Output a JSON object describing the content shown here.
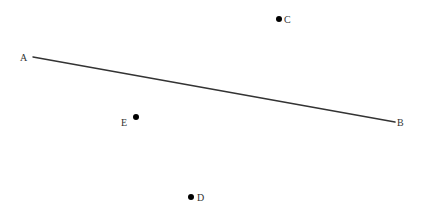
{
  "diagram": {
    "colors": {
      "line": "#333333",
      "point": "#000000",
      "label": "#333333",
      "background": "#ffffff"
    },
    "segment": {
      "from": "A",
      "to": "B",
      "x1": 33,
      "y1": 57,
      "x2": 395,
      "y2": 122
    },
    "labels": {
      "A": "A",
      "B": "B",
      "C": "C",
      "D": "D",
      "E": "E"
    },
    "points": [
      {
        "name": "C",
        "x": 279,
        "y": 19
      },
      {
        "name": "E",
        "x": 136,
        "y": 117
      },
      {
        "name": "D",
        "x": 191,
        "y": 197
      }
    ]
  }
}
